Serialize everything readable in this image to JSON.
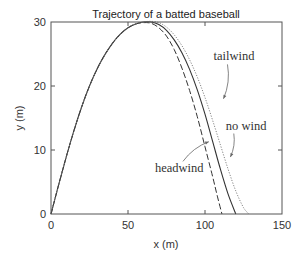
{
  "chart_data": {
    "type": "line",
    "title": "Trajectory of a batted baseball",
    "xlabel": "x (m)",
    "ylabel": "y (m)",
    "xlim": [
      0,
      150
    ],
    "ylim": [
      0,
      30
    ],
    "xticks": [
      0,
      50,
      100,
      150
    ],
    "yticks": [
      0,
      10,
      20,
      30
    ],
    "grid": false,
    "legend": "none (inline annotations)",
    "series": [
      {
        "name": "no wind",
        "style": "solid",
        "x": [
          0,
          5,
          10,
          15,
          20,
          25,
          30,
          35,
          40,
          45,
          50,
          55,
          60,
          65,
          70,
          75,
          80,
          85,
          90,
          95,
          100,
          105,
          110,
          115,
          120
        ],
        "y": [
          0,
          4.6,
          9.0,
          13.1,
          16.8,
          20.0,
          22.7,
          24.9,
          26.7,
          28.1,
          29.1,
          29.7,
          30.0,
          30.0,
          29.6,
          28.7,
          27.2,
          25.2,
          22.6,
          19.4,
          15.6,
          11.3,
          7.0,
          3.1,
          0
        ]
      },
      {
        "name": "headwind",
        "style": "dashed",
        "x": [
          0,
          5,
          10,
          15,
          20,
          25,
          30,
          35,
          40,
          45,
          50,
          55,
          60,
          65,
          70,
          75,
          80,
          85,
          90,
          95,
          100,
          105,
          108,
          111
        ],
        "y": [
          0,
          4.6,
          9.0,
          13.1,
          16.8,
          20.0,
          22.7,
          24.9,
          26.7,
          28.1,
          29.1,
          29.7,
          29.9,
          29.8,
          29.1,
          27.8,
          25.7,
          22.8,
          19.3,
          15.2,
          10.5,
          5.8,
          2.8,
          0
        ]
      },
      {
        "name": "tailwind",
        "style": "dotted",
        "x": [
          0,
          5,
          10,
          15,
          20,
          25,
          30,
          35,
          40,
          45,
          50,
          55,
          60,
          65,
          70,
          75,
          80,
          85,
          90,
          95,
          100,
          105,
          110,
          115,
          120,
          125,
          128.5
        ],
        "y": [
          0,
          4.6,
          9.0,
          13.1,
          16.8,
          20.0,
          22.7,
          24.9,
          26.7,
          28.1,
          29.1,
          29.7,
          30.0,
          30.1,
          29.9,
          29.2,
          28.0,
          26.3,
          24.1,
          21.4,
          18.2,
          14.6,
          10.8,
          7.0,
          3.6,
          1.0,
          0
        ]
      }
    ],
    "annotations": [
      {
        "text": "tailwind",
        "x": 105.5,
        "y": 24.0,
        "arrow_to": [
          112,
          18.0
        ]
      },
      {
        "text": "no wind",
        "x": 113.5,
        "y": 13.2,
        "arrow_to": [
          116.5,
          8.9
        ]
      },
      {
        "text": "headwind",
        "x": 67.5,
        "y": 6.5,
        "arrow_to": [
          102.5,
          11.3
        ]
      }
    ]
  }
}
